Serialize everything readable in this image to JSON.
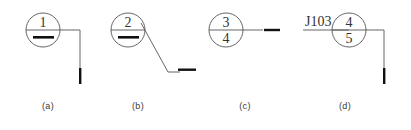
{
  "figure": {
    "type": "technical-drawing",
    "background_color": "#ffffff",
    "line_color": "#555555",
    "marker_color": "#111111",
    "text_color": "#333333",
    "width": 411,
    "height": 130
  },
  "panels": [
    {
      "id": "a",
      "caption": "(a)",
      "circle": {
        "cx": 43,
        "cy": 30,
        "r": 17,
        "top_label": "1",
        "bottom_label": "",
        "bottom_is_dash": true,
        "has_divider": true
      },
      "reference_line": {
        "shape": "right-then-down",
        "start_x": 60,
        "start_y": 30,
        "corner_x": 80,
        "corner_y": 30,
        "end_x": 80,
        "end_y": 82
      },
      "terminal_marker": {
        "orientation": "vertical",
        "x": 80,
        "y1": 68,
        "y2": 84
      },
      "tag_label": ""
    },
    {
      "id": "b",
      "caption": "(b)",
      "circle": {
        "cx": 128,
        "cy": 30,
        "r": 17,
        "top_label": "2",
        "bottom_label": "",
        "bottom_is_dash": true,
        "has_divider": true
      },
      "reference_line": {
        "shape": "diagonal-then-right",
        "start_x": 141,
        "start_y": 23,
        "corner_x": 168,
        "corner_y": 72,
        "end_x": 178,
        "end_y": 72
      },
      "terminal_marker": {
        "orientation": "horizontal",
        "y": 69,
        "x1": 178,
        "x2": 196
      },
      "tag_label": ""
    },
    {
      "id": "c",
      "caption": "(c)",
      "circle": {
        "cx": 226,
        "cy": 30,
        "r": 17,
        "top_label": "3",
        "bottom_label": "4",
        "bottom_is_dash": false,
        "has_divider": true
      },
      "reference_line": {
        "shape": "horizontal",
        "start_x": 243,
        "start_y": 30,
        "corner_x": 262,
        "corner_y": 30,
        "end_x": 262,
        "end_y": 30
      },
      "terminal_marker": {
        "orientation": "horizontal",
        "y": 30,
        "x1": 264,
        "x2": 280
      },
      "tag_label": ""
    },
    {
      "id": "d",
      "caption": "(d)",
      "circle": {
        "cx": 349,
        "cy": 30,
        "r": 17,
        "top_label": "4",
        "bottom_label": "5",
        "bottom_is_dash": false,
        "has_divider": true
      },
      "reference_line": {
        "shape": "right-then-down",
        "start_x": 366,
        "start_y": 30,
        "corner_x": 384,
        "corner_y": 30,
        "end_x": 384,
        "end_y": 82
      },
      "terminal_marker": {
        "orientation": "vertical",
        "x": 384,
        "y1": 68,
        "y2": 84
      },
      "tag_label": "J103",
      "tag_label_x": 305,
      "tag_label_y": 26,
      "tag_underline": {
        "x1": 303,
        "x2": 349,
        "y": 30
      }
    }
  ],
  "captions": {
    "a": "(a)",
    "b": "(b)",
    "c": "(c)",
    "d": "(d)"
  }
}
